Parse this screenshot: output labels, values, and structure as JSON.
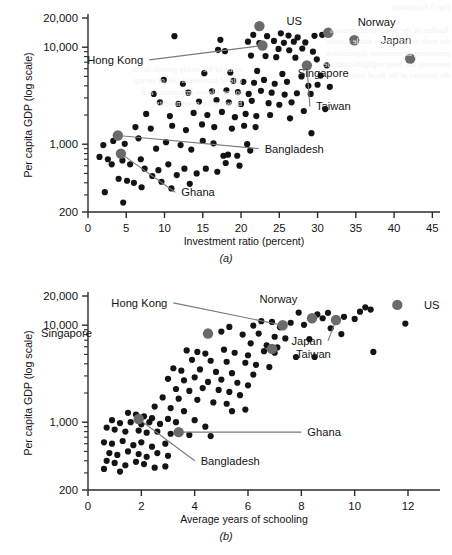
{
  "figure": {
    "panels": [
      "(a)",
      "(b)"
    ],
    "bleed_text": "Part 3 Economics\n\nAnother of the ﬁrst-rate economists\nthe trade deﬁcit over a stable growth\npreventing an excessive depreciation\npayments has been negligible and the\nthe incomes of the ﬁscal year",
    "bleed_text2": "some of the steady growth in the\nrate of increase in rate of saving\nto the relative importance and\nbetween the governments"
  },
  "chart_data": [
    {
      "type": "scatter",
      "panel": "(a)",
      "title": "",
      "xlabel": "Investment ratio (percent)",
      "ylabel": "Per capita GDP (log scale)",
      "yscale": "log",
      "xlim": [
        0,
        46
      ],
      "ylim": [
        200,
        20000
      ],
      "xticks": [
        0,
        5,
        10,
        15,
        20,
        25,
        30,
        35,
        40,
        45
      ],
      "xticklabels": [
        "0",
        "5",
        "10",
        "15",
        "20",
        "25",
        "30",
        "35",
        "40",
        "45"
      ],
      "yticks": [
        200,
        1000,
        10000,
        20000
      ],
      "yticklabels": [
        "200",
        "1,000",
        "10,000",
        "20,000"
      ],
      "grid": false,
      "legend": "none",
      "annotations": [
        {
          "label": "US",
          "x": 22.4,
          "y": 16500,
          "label_x": 24.9,
          "label_y": 18700,
          "leader": false
        },
        {
          "label": "Norway",
          "x": 31.4,
          "y": 14100,
          "label_x": 34.2,
          "label_y": 18100,
          "leader": false
        },
        {
          "label": "Japan",
          "x": 34.8,
          "y": 11800,
          "label_x": 37.2,
          "label_y": 11800,
          "leader": false
        },
        {
          "label": "Singapore",
          "x": 42.1,
          "y": 7600,
          "label_x": 34.6,
          "label_y": 5400,
          "leader": false
        },
        {
          "label": "Hong Kong",
          "x": 22.8,
          "y": 10400,
          "label_x": 8.0,
          "label_y": 7400,
          "leader": true
        },
        {
          "label": "Taiwan",
          "x": 28.6,
          "y": 6500,
          "label_x": 29.0,
          "label_y": 2450,
          "leader": true
        },
        {
          "label": "Bangladesh",
          "x": 3.9,
          "y": 1230,
          "label_x": 22.3,
          "label_y": 900,
          "leader": true
        },
        {
          "label": "Ghana",
          "x": 4.3,
          "y": 800,
          "label_x": 11.4,
          "label_y": 320,
          "leader": true
        }
      ],
      "highlighted": [
        {
          "name": "US",
          "x": 22.4,
          "y": 16500
        },
        {
          "name": "Norway",
          "x": 31.4,
          "y": 14100
        },
        {
          "name": "Japan",
          "x": 34.8,
          "y": 11800
        },
        {
          "name": "Singapore",
          "x": 42.1,
          "y": 7600
        },
        {
          "name": "Hong Kong",
          "x": 22.8,
          "y": 10400
        },
        {
          "name": "Taiwan",
          "x": 28.6,
          "y": 6500
        },
        {
          "name": "Bangladesh",
          "x": 3.9,
          "y": 1230
        },
        {
          "name": "Ghana",
          "x": 4.3,
          "y": 800
        }
      ],
      "points": [
        [
          11.3,
          13000
        ],
        [
          17.3,
          11900
        ],
        [
          21.6,
          13400
        ],
        [
          23.4,
          13000
        ],
        [
          25.2,
          13900
        ],
        [
          26.2,
          13200
        ],
        [
          27.4,
          12600
        ],
        [
          29.6,
          13100
        ],
        [
          30.6,
          13400
        ],
        [
          20.9,
          11400
        ],
        [
          22.4,
          11000
        ],
        [
          24.3,
          11600
        ],
        [
          25.6,
          11100
        ],
        [
          26.9,
          11400
        ],
        [
          28.4,
          11200
        ],
        [
          17.0,
          9400
        ],
        [
          17.9,
          9100
        ],
        [
          24.9,
          9600
        ],
        [
          26.3,
          9300
        ],
        [
          28.0,
          9700
        ],
        [
          29.4,
          9000
        ],
        [
          21.3,
          8200
        ],
        [
          23.2,
          8100
        ],
        [
          24.6,
          7900
        ],
        [
          27.1,
          7800
        ],
        [
          29.9,
          7500
        ],
        [
          31.2,
          6500
        ],
        [
          15.2,
          5400
        ],
        [
          18.6,
          5500
        ],
        [
          22.1,
          5700
        ],
        [
          25.4,
          5300
        ],
        [
          27.9,
          5000
        ],
        [
          30.4,
          5100
        ],
        [
          9.9,
          4600
        ],
        [
          12.4,
          4200
        ],
        [
          19.0,
          4500
        ],
        [
          20.3,
          4400
        ],
        [
          21.7,
          4300
        ],
        [
          23.0,
          4600
        ],
        [
          24.4,
          4200
        ],
        [
          26.0,
          4400
        ],
        [
          28.8,
          4000
        ],
        [
          30.0,
          4100
        ],
        [
          31.6,
          3900
        ],
        [
          8.6,
          3300
        ],
        [
          13.1,
          3400
        ],
        [
          16.2,
          3500
        ],
        [
          18.1,
          3600
        ],
        [
          19.6,
          3450
        ],
        [
          21.0,
          3300
        ],
        [
          22.6,
          3550
        ],
        [
          24.0,
          3400
        ],
        [
          25.7,
          3250
        ],
        [
          27.3,
          3350
        ],
        [
          29.1,
          3300
        ],
        [
          9.4,
          2700
        ],
        [
          11.8,
          2600
        ],
        [
          14.5,
          2750
        ],
        [
          16.8,
          2850
        ],
        [
          18.4,
          2700
        ],
        [
          20.0,
          2600
        ],
        [
          21.4,
          2800
        ],
        [
          23.6,
          2650
        ],
        [
          25.0,
          2550
        ],
        [
          26.6,
          2700
        ],
        [
          28.2,
          2200
        ],
        [
          31.0,
          2300
        ],
        [
          7.6,
          2050
        ],
        [
          10.7,
          1950
        ],
        [
          13.8,
          2100
        ],
        [
          15.6,
          2000
        ],
        [
          17.5,
          2150
        ],
        [
          19.2,
          1900
        ],
        [
          20.6,
          2050
        ],
        [
          22.0,
          1950
        ],
        [
          23.8,
          2000
        ],
        [
          26.4,
          1850
        ],
        [
          29.2,
          1300
        ],
        [
          6.2,
          1500
        ],
        [
          8.2,
          1450
        ],
        [
          11.0,
          1550
        ],
        [
          12.8,
          1400
        ],
        [
          14.9,
          1600
        ],
        [
          16.5,
          1500
        ],
        [
          18.8,
          1450
        ],
        [
          20.4,
          1550
        ],
        [
          21.9,
          1500
        ],
        [
          2.0,
          980
        ],
        [
          3.3,
          1080
        ],
        [
          4.8,
          1010
        ],
        [
          6.6,
          1150
        ],
        [
          8.9,
          900
        ],
        [
          10.2,
          1050
        ],
        [
          12.1,
          980
        ],
        [
          13.5,
          880
        ],
        [
          15.0,
          1080
        ],
        [
          16.4,
          1020
        ],
        [
          17.7,
          760
        ],
        [
          18.3,
          780
        ],
        [
          19.5,
          760
        ],
        [
          20.8,
          1000
        ],
        [
          21.2,
          860
        ],
        [
          1.5,
          740
        ],
        [
          2.6,
          700
        ],
        [
          3.1,
          620
        ],
        [
          4.5,
          680
        ],
        [
          5.5,
          620
        ],
        [
          6.9,
          700
        ],
        [
          7.4,
          560
        ],
        [
          9.2,
          540
        ],
        [
          10.5,
          620
        ],
        [
          11.6,
          480
        ],
        [
          12.6,
          560
        ],
        [
          14.2,
          500
        ],
        [
          15.4,
          560
        ],
        [
          16.9,
          520
        ],
        [
          18.0,
          640
        ],
        [
          19.8,
          600
        ],
        [
          2.2,
          320
        ],
        [
          4.0,
          440
        ],
        [
          5.1,
          420
        ],
        [
          6.0,
          400
        ],
        [
          7.0,
          360
        ],
        [
          8.4,
          470
        ],
        [
          9.6,
          410
        ],
        [
          10.9,
          350
        ],
        [
          13.3,
          390
        ],
        [
          4.6,
          250
        ]
      ]
    },
    {
      "type": "scatter",
      "panel": "(b)",
      "title": "",
      "xlabel": "Average years of schooling",
      "ylabel": "Per capita GDP (log scale)",
      "yscale": "log",
      "xlim": [
        0,
        13.2
      ],
      "ylim": [
        200,
        20000
      ],
      "xticks": [
        0,
        2,
        4,
        6,
        8,
        10,
        12
      ],
      "xticklabels": [
        "0",
        "2",
        "4",
        "6",
        "8",
        "10",
        "12"
      ],
      "yticks": [
        200,
        1000,
        10000,
        20000
      ],
      "yticklabels": [
        "200",
        "1,000",
        "10,000",
        "20,000"
      ],
      "grid": false,
      "legend": "none",
      "annotations": [
        {
          "label": "Norway",
          "x": 8.4,
          "y": 11800,
          "label_x": 8.0,
          "label_y": 18700,
          "leader": false
        },
        {
          "label": "US",
          "x": 11.6,
          "y": 16200,
          "label_x": 12.3,
          "label_y": 16200,
          "leader": false
        },
        {
          "label": "Hong Kong",
          "x": 7.3,
          "y": 10000,
          "label_x": 3.2,
          "label_y": 17000,
          "leader": true
        },
        {
          "label": "Japan",
          "x": 9.3,
          "y": 11300,
          "label_x": 9.0,
          "label_y": 6900,
          "leader": true
        },
        {
          "label": "Singapore",
          "x": 4.5,
          "y": 8200,
          "label_x": 0.3,
          "label_y": 8300,
          "leader": false
        },
        {
          "label": "Taiwan",
          "x": 6.9,
          "y": 5700,
          "label_x": 7.5,
          "label_y": 5000,
          "leader": false
        },
        {
          "label": "Ghana",
          "x": 3.4,
          "y": 790,
          "label_x": 8.0,
          "label_y": 790,
          "leader": true
        },
        {
          "label": "Bangladesh",
          "x": 1.9,
          "y": 1080,
          "label_x": 4.0,
          "label_y": 400,
          "leader": true
        }
      ],
      "highlighted": [
        {
          "name": "Norway",
          "x": 8.4,
          "y": 11800
        },
        {
          "name": "US",
          "x": 11.6,
          "y": 16200
        },
        {
          "name": "Hong Kong",
          "x": 7.3,
          "y": 10000
        },
        {
          "name": "Japan",
          "x": 9.3,
          "y": 11300
        },
        {
          "name": "Singapore",
          "x": 4.5,
          "y": 8200
        },
        {
          "name": "Taiwan",
          "x": 6.9,
          "y": 5700
        },
        {
          "name": "Ghana",
          "x": 3.4,
          "y": 790
        },
        {
          "name": "Bangladesh",
          "x": 1.9,
          "y": 1080
        }
      ],
      "points": [
        [
          10.4,
          15300
        ],
        [
          10.6,
          14500
        ],
        [
          10.2,
          13800
        ],
        [
          9.0,
          13400
        ],
        [
          8.6,
          12900
        ],
        [
          9.6,
          12200
        ],
        [
          10.0,
          11600
        ],
        [
          11.9,
          10400
        ],
        [
          7.9,
          13500
        ],
        [
          8.8,
          11800
        ],
        [
          6.5,
          11000
        ],
        [
          6.9,
          10800
        ],
        [
          7.6,
          10600
        ],
        [
          6.2,
          9900
        ],
        [
          7.2,
          9500
        ],
        [
          8.1,
          10100
        ],
        [
          9.1,
          9300
        ],
        [
          5.3,
          9600
        ],
        [
          5.0,
          8600
        ],
        [
          5.8,
          8000
        ],
        [
          6.4,
          8200
        ],
        [
          7.0,
          7600
        ],
        [
          7.4,
          7300
        ],
        [
          8.3,
          7200
        ],
        [
          9.5,
          8100
        ],
        [
          6.1,
          6500
        ],
        [
          6.7,
          6200
        ],
        [
          7.1,
          5900
        ],
        [
          6.6,
          5400
        ],
        [
          7.0,
          5200
        ],
        [
          10.7,
          5300
        ],
        [
          3.7,
          5500
        ],
        [
          4.1,
          5300
        ],
        [
          4.4,
          5100
        ],
        [
          5.1,
          5600
        ],
        [
          5.5,
          5200
        ],
        [
          6.0,
          4900
        ],
        [
          7.8,
          4700
        ],
        [
          8.5,
          4700
        ],
        [
          3.9,
          4400
        ],
        [
          4.6,
          4300
        ],
        [
          5.2,
          4200
        ],
        [
          5.9,
          4100
        ],
        [
          6.3,
          3900
        ],
        [
          6.8,
          3700
        ],
        [
          3.2,
          3600
        ],
        [
          3.5,
          3400
        ],
        [
          4.2,
          3500
        ],
        [
          4.8,
          3300
        ],
        [
          5.4,
          3200
        ],
        [
          6.2,
          3100
        ],
        [
          3.0,
          2800
        ],
        [
          3.6,
          2700
        ],
        [
          4.0,
          2900
        ],
        [
          4.5,
          2600
        ],
        [
          5.0,
          2750
        ],
        [
          5.6,
          2550
        ],
        [
          6.0,
          2400
        ],
        [
          3.3,
          2200
        ],
        [
          3.8,
          2100
        ],
        [
          4.3,
          2250
        ],
        [
          4.9,
          2150
        ],
        [
          5.3,
          2050
        ],
        [
          5.7,
          1900
        ],
        [
          2.8,
          1800
        ],
        [
          3.4,
          1750
        ],
        [
          4.1,
          1700
        ],
        [
          4.7,
          1600
        ],
        [
          5.2,
          1550
        ],
        [
          5.9,
          1350
        ],
        [
          2.5,
          1450
        ],
        [
          3.1,
          1400
        ],
        [
          3.6,
          1300
        ],
        [
          1.5,
          1250
        ],
        [
          1.8,
          1200
        ],
        [
          2.1,
          1150
        ],
        [
          2.4,
          1100
        ],
        [
          0.9,
          1050
        ],
        [
          1.2,
          980
        ],
        [
          1.6,
          1000
        ],
        [
          2.0,
          950
        ],
        [
          2.3,
          1000
        ],
        [
          2.7,
          960
        ],
        [
          3.0,
          1080
        ],
        [
          3.3,
          1000
        ],
        [
          4.0,
          1050
        ],
        [
          4.4,
          900
        ],
        [
          0.7,
          880
        ],
        [
          1.0,
          840
        ],
        [
          1.4,
          800
        ],
        [
          1.9,
          820
        ],
        [
          2.2,
          780
        ],
        [
          2.6,
          800
        ],
        [
          3.1,
          760
        ],
        [
          3.8,
          740
        ],
        [
          4.6,
          720
        ],
        [
          5.4,
          1300
        ],
        [
          0.6,
          620
        ],
        [
          0.9,
          600
        ],
        [
          1.3,
          640
        ],
        [
          1.7,
          580
        ],
        [
          2.0,
          620
        ],
        [
          2.4,
          560
        ],
        [
          2.9,
          600
        ],
        [
          0.8,
          480
        ],
        [
          1.1,
          460
        ],
        [
          1.5,
          500
        ],
        [
          1.9,
          470
        ],
        [
          2.2,
          440
        ],
        [
          2.6,
          480
        ],
        [
          3.0,
          450
        ],
        [
          0.7,
          400
        ],
        [
          1.0,
          380
        ],
        [
          1.4,
          360
        ],
        [
          1.8,
          390
        ],
        [
          2.1,
          370
        ],
        [
          2.5,
          340
        ],
        [
          2.9,
          350
        ],
        [
          0.6,
          330
        ],
        [
          1.2,
          310
        ]
      ]
    }
  ],
  "style": {
    "point_color": "#141414",
    "highlight_color": "#6b6b6b",
    "axis_color": "#2b2b2b",
    "leader_color": "#7a7a7a",
    "background": "#ffffff"
  }
}
